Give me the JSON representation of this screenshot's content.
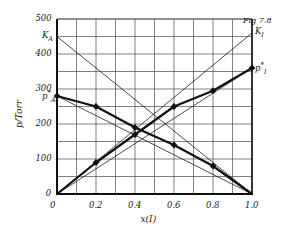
{
  "figure": {
    "caption": "Fig 7.8"
  },
  "chart_data": {
    "type": "line",
    "title": "",
    "subtitle": "",
    "xlabel": "x(I)",
    "ylabel": "p/Torr",
    "xlim": [
      0,
      1.0
    ],
    "ylim": [
      0,
      500
    ],
    "grid": true,
    "grid_x_step": 0.1,
    "grid_y_step": 50,
    "legend": "none",
    "xticks": [
      {
        "value": 0,
        "label": "0"
      },
      {
        "value": 0.2,
        "label": "0.2"
      },
      {
        "value": 0.4,
        "label": "0.4"
      },
      {
        "value": 0.6,
        "label": "0.6"
      },
      {
        "value": 0.8,
        "label": "0.8"
      },
      {
        "value": 1.0,
        "label": "1.0"
      }
    ],
    "yticks": [
      {
        "value": 0,
        "label": "0"
      },
      {
        "value": 100,
        "label": "100"
      },
      {
        "value": 200,
        "label": "200"
      },
      {
        "value": 300,
        "label": "300"
      },
      {
        "value": 400,
        "label": "400"
      },
      {
        "value": 500,
        "label": "500"
      }
    ],
    "series": [
      {
        "name": "p_A (partial pressure of A)",
        "style": "bold-curve-with-markers",
        "x": [
          0,
          0.2,
          0.4,
          0.6,
          0.8,
          1.0
        ],
        "values": [
          280,
          250,
          190,
          140,
          80,
          0
        ],
        "markers": true
      },
      {
        "name": "p_I (partial pressure of I)",
        "style": "bold-curve-with-markers",
        "x": [
          0,
          0.2,
          0.4,
          0.6,
          0.8,
          1.0
        ],
        "values": [
          0,
          90,
          170,
          250,
          295,
          360
        ],
        "markers": true
      },
      {
        "name": "K_A (Henry's law line for A)",
        "style": "thin-line",
        "x": [
          0,
          1.0
        ],
        "values": [
          450,
          0
        ],
        "markers": false
      },
      {
        "name": "K_I (Henry's law line for I)",
        "style": "thin-line",
        "x": [
          0,
          1.0
        ],
        "values": [
          0,
          460
        ],
        "markers": false
      },
      {
        "name": "Raoult's law line for A",
        "style": "thin-line",
        "x": [
          0,
          1.0
        ],
        "values": [
          280,
          0
        ],
        "markers": false
      },
      {
        "name": "Raoult's law line for I",
        "style": "thin-line",
        "x": [
          0,
          1.0
        ],
        "values": [
          0,
          360
        ],
        "markers": false
      }
    ],
    "annotations": [
      {
        "id": "K_A",
        "text": "K",
        "sub": "A",
        "sup": "",
        "x": 0.0,
        "y": 450,
        "position": "left"
      },
      {
        "id": "K_I",
        "text": "K",
        "sub": "I",
        "sup": "",
        "x": 1.0,
        "y": 460,
        "position": "right"
      },
      {
        "id": "p_A",
        "text": "p",
        "sub": "A",
        "sup": "*",
        "x": 0.0,
        "y": 280,
        "position": "left"
      },
      {
        "id": "p_I",
        "text": "p",
        "sub": "I",
        "sup": "*",
        "x": 1.0,
        "y": 360,
        "position": "right"
      }
    ]
  }
}
